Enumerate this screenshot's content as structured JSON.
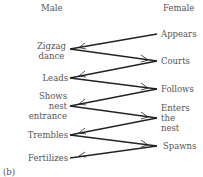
{
  "headers": {
    "male": "Male",
    "female": "Female"
  },
  "male_steps": [
    {
      "label_lines": [
        "Zigzag",
        "dance"
      ]
    },
    {
      "label_lines": [
        "Leads"
      ]
    },
    {
      "label_lines": [
        "Shows",
        "nest",
        "entrance"
      ]
    },
    {
      "label_lines": [
        "Trembles"
      ]
    },
    {
      "label_lines": [
        "Fertilizes"
      ]
    }
  ],
  "female_steps": [
    {
      "label_lines": [
        "Appears"
      ]
    },
    {
      "label_lines": [
        "Courts"
      ]
    },
    {
      "label_lines": [
        "Follows"
      ]
    },
    {
      "label_lines": [
        "Enters",
        "the",
        "nest"
      ]
    },
    {
      "label_lines": [
        "Spawns"
      ]
    }
  ],
  "panel_label": "(b)",
  "colors": {
    "line": "#222222",
    "text": "#555555"
  }
}
